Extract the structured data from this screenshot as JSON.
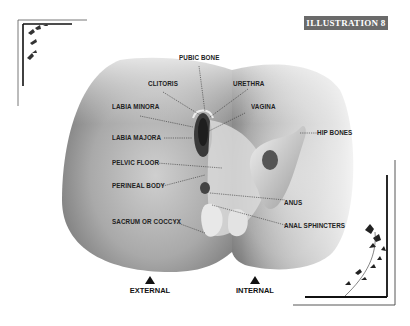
{
  "header": {
    "badge": "ILLUSTRATION 8"
  },
  "labels": {
    "pubic_bone": "PUBIC BONE",
    "clitoris": "CLITORIS",
    "urethra": "URETHRA",
    "labia_minora": "LABIA MINORA",
    "vagina": "VAGINA",
    "labia_majora": "LABIA MAJORA",
    "hip_bones": "HIP BONES",
    "pelvic_floor": "PELVIC FLOOR",
    "perineal_body": "PERINEAL BODY",
    "anus": "ANUS",
    "sacrum": "SACRUM OR COCCYX",
    "anal_sphincters": "ANAL SPHINCTERS"
  },
  "views": {
    "external": "EXTERNAL",
    "internal": "INTERNAL"
  }
}
